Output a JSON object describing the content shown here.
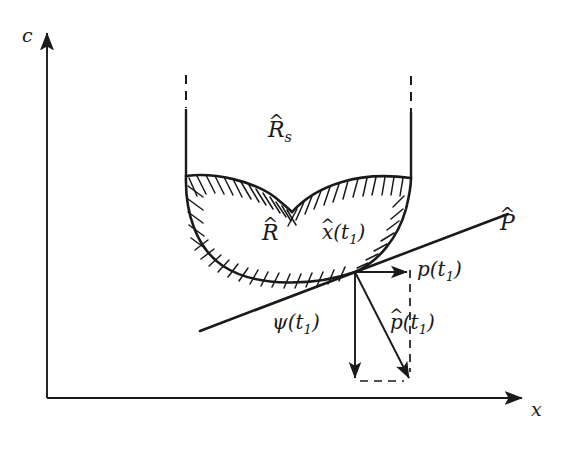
{
  "figure": {
    "background_color": "#ffffff",
    "ink_color": "#1a1a1a"
  },
  "axes": {
    "vertical_label": "c",
    "horizontal_label": "x",
    "origin": [
      47,
      398
    ],
    "vertical_top": [
      47,
      28
    ],
    "horizontal_right": [
      528,
      398
    ]
  },
  "labels": {
    "region_s": {
      "base": "R",
      "hat": "^",
      "subscript": "s"
    },
    "region": {
      "base": "R",
      "hat": "^"
    },
    "state": {
      "base": "x",
      "hat": "^",
      "arg": "(t",
      "sub": "1",
      "close": ")"
    },
    "hyperplane": {
      "base": "P",
      "hat": "^"
    },
    "p": {
      "base": "p",
      "arg": "(t",
      "sub": "1",
      "close": ")"
    },
    "p_hat": {
      "base": "p",
      "hat": "^",
      "arg": "(t",
      "sub": "1",
      "close": ")"
    },
    "psi": {
      "base": "ψ",
      "arg": "(t",
      "sub": "1",
      "close": ")"
    }
  },
  "geometry": {
    "tangent_point": [
      355,
      272
    ],
    "hyperplane_line": {
      "from": [
        200,
        331
      ],
      "to": [
        508,
        214
      ]
    },
    "left_wall_x": 186,
    "right_wall_x": 411,
    "wall_solid_top": 110,
    "wall_dashed_top": 75,
    "cusp": [
      292,
      212
    ],
    "p_vector": {
      "from": [
        355,
        272
      ],
      "to": [
        410,
        272
      ]
    },
    "psi_vector": {
      "from": [
        355,
        272
      ],
      "to": [
        355,
        381
      ]
    },
    "p_hat_vector": {
      "from": [
        355,
        272
      ],
      "to": [
        410,
        381
      ]
    }
  },
  "style_notes": {
    "hatching": "short strokes inward from region boundary",
    "dashed_segments": [
      "wall extensions above region",
      "rectangle closing the vector parallelogram"
    ]
  }
}
